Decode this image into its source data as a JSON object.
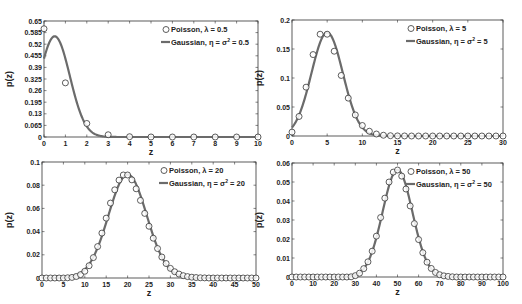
{
  "chart_data": [
    {
      "type": "line",
      "title": "",
      "xlabel": "z",
      "ylabel": "p(z)",
      "xlim": [
        0,
        10
      ],
      "ylim": [
        0,
        0.65
      ],
      "xticks": [
        "0",
        "1",
        "2",
        "3",
        "4",
        "5",
        "6",
        "7",
        "8",
        "9",
        "10"
      ],
      "xtick_values": [
        0,
        1,
        2,
        3,
        4,
        5,
        6,
        7,
        8,
        9,
        10
      ],
      "yticks": [
        "0",
        "0.065",
        "0.13",
        "0.195",
        "0.26",
        "0.325",
        "0.39",
        "0.455",
        "0.52",
        "0.585",
        "0.65"
      ],
      "ytick_values": [
        0,
        0.065,
        0.13,
        0.195,
        0.26,
        0.325,
        0.39,
        0.455,
        0.52,
        0.585,
        0.65
      ],
      "legend_position": "top-right",
      "series": [
        {
          "name": "Poisson, λ = 0.5",
          "style": "markers-circle",
          "x": [
            0,
            1,
            2,
            3,
            4,
            5,
            6,
            7,
            8,
            9,
            10
          ],
          "y": [
            0.6065,
            0.3033,
            0.0758,
            0.0126,
            0.0016,
            0.0002,
            0,
            0,
            0,
            0,
            0
          ]
        },
        {
          "name": "Gaussian, η = σ² = 0.5",
          "style": "line",
          "mean": 0.5,
          "variance": 0.5,
          "x_range": [
            0,
            10
          ]
        }
      ],
      "legend": {
        "poisson": "Poisson, λ = 0.5",
        "gaussian_prefix": "Gaussian, η = σ",
        "gaussian_suffix": " = 0.5"
      }
    },
    {
      "type": "line",
      "title": "",
      "xlabel": "z",
      "ylabel": "p(z)",
      "xlim": [
        0,
        30
      ],
      "ylim": [
        0,
        0.2
      ],
      "xticks": [
        "0",
        "5",
        "10",
        "15",
        "20",
        "25",
        "30"
      ],
      "xtick_values": [
        0,
        5,
        10,
        15,
        20,
        25,
        30
      ],
      "yticks": [
        "0",
        "0.05",
        "0.1",
        "0.15",
        "0.2"
      ],
      "ytick_values": [
        0,
        0.05,
        0.1,
        0.15,
        0.2
      ],
      "legend_position": "top-right",
      "series": [
        {
          "name": "Poisson, λ = 5",
          "style": "markers-circle",
          "x": [
            0,
            1,
            2,
            3,
            4,
            5,
            6,
            7,
            8,
            9,
            10,
            11,
            12,
            13,
            14,
            15,
            16,
            17,
            18,
            19,
            20,
            21,
            22,
            23,
            24,
            25,
            26,
            27,
            28,
            29,
            30
          ],
          "y": [
            0.0067,
            0.0337,
            0.0842,
            0.1404,
            0.1755,
            0.1755,
            0.1462,
            0.1044,
            0.0653,
            0.0363,
            0.0181,
            0.0082,
            0.0034,
            0.0013,
            0.0005,
            0.0002,
            0.0001,
            0,
            0,
            0,
            0,
            0,
            0,
            0,
            0,
            0,
            0,
            0,
            0,
            0,
            0
          ]
        },
        {
          "name": "Gaussian, η = σ² = 5",
          "style": "line",
          "mean": 5,
          "variance": 5,
          "x_range": [
            0,
            30
          ]
        }
      ],
      "legend": {
        "poisson": "Poisson, λ = 5",
        "gaussian_prefix": "Gaussian, η = σ",
        "gaussian_suffix": " = 5"
      }
    },
    {
      "type": "line",
      "title": "",
      "xlabel": "z",
      "ylabel": "p(z)",
      "xlim": [
        0,
        50
      ],
      "ylim": [
        0,
        0.1
      ],
      "xticks": [
        "0",
        "5",
        "10",
        "15",
        "20",
        "25",
        "30",
        "35",
        "40",
        "45",
        "50"
      ],
      "xtick_values": [
        0,
        5,
        10,
        15,
        20,
        25,
        30,
        35,
        40,
        45,
        50
      ],
      "yticks": [
        "0",
        "0.02",
        "0.04",
        "0.06",
        "0.08",
        "0.1"
      ],
      "ytick_values": [
        0,
        0.02,
        0.04,
        0.06,
        0.08,
        0.1
      ],
      "legend_position": "top-right",
      "series": [
        {
          "name": "Poisson, λ = 20",
          "style": "markers-circle",
          "x": [
            0,
            1,
            2,
            3,
            4,
            5,
            6,
            7,
            8,
            9,
            10,
            11,
            12,
            13,
            14,
            15,
            16,
            17,
            18,
            19,
            20,
            21,
            22,
            23,
            24,
            25,
            26,
            27,
            28,
            29,
            30,
            31,
            32,
            33,
            34,
            35,
            36,
            37,
            38,
            39,
            40,
            41,
            42,
            43,
            44,
            45,
            46,
            47,
            48,
            49,
            50
          ],
          "y": [
            0,
            0,
            0,
            0,
            0,
            0,
            0.0002,
            0.0005,
            0.0013,
            0.0029,
            0.0058,
            0.0106,
            0.0176,
            0.0271,
            0.0387,
            0.0516,
            0.0646,
            0.076,
            0.0844,
            0.0888,
            0.0888,
            0.0846,
            0.0769,
            0.0669,
            0.0557,
            0.0446,
            0.0343,
            0.0254,
            0.0181,
            0.0125,
            0.0083,
            0.0054,
            0.0034,
            0.002,
            0.0012,
            0.0007,
            0.0004,
            0.0002,
            0.0001,
            0,
            0,
            0,
            0,
            0,
            0,
            0,
            0,
            0,
            0,
            0,
            0
          ]
        },
        {
          "name": "Gaussian, η = σ² = 20",
          "style": "line",
          "mean": 20,
          "variance": 20,
          "x_range": [
            0,
            50
          ]
        }
      ],
      "legend": {
        "poisson": "Poisson, λ = 20",
        "gaussian_prefix": "Gaussian, η = σ",
        "gaussian_suffix": " = 20"
      }
    },
    {
      "type": "line",
      "title": "",
      "xlabel": "z",
      "ylabel": "p(z)",
      "xlim": [
        0,
        100
      ],
      "ylim": [
        0,
        0.06
      ],
      "xticks": [
        "0",
        "10",
        "20",
        "30",
        "40",
        "50",
        "60",
        "70",
        "80",
        "90",
        "100"
      ],
      "xtick_values": [
        0,
        10,
        20,
        30,
        40,
        50,
        60,
        70,
        80,
        90,
        100
      ],
      "yticks": [
        "0",
        "0.01",
        "0.02",
        "0.03",
        "0.04",
        "0.05",
        "0.06"
      ],
      "ytick_values": [
        0,
        0.01,
        0.02,
        0.03,
        0.04,
        0.05,
        0.06
      ],
      "legend_position": "top-right",
      "series": [
        {
          "name": "Poisson, λ = 50",
          "style": "markers-circle",
          "x": [
            0,
            2,
            4,
            6,
            8,
            10,
            12,
            14,
            16,
            18,
            20,
            22,
            24,
            26,
            28,
            30,
            32,
            34,
            36,
            38,
            40,
            42,
            44,
            46,
            48,
            50,
            52,
            54,
            56,
            58,
            60,
            62,
            64,
            66,
            68,
            70,
            72,
            74,
            76,
            78,
            80,
            82,
            84,
            86,
            88,
            90,
            92,
            94,
            96,
            98,
            100
          ],
          "y": [
            0,
            0,
            0,
            0,
            0,
            0,
            0,
            0,
            0,
            0,
            0,
            0,
            0,
            0,
            0.0001,
            0.0007,
            0.002,
            0.0044,
            0.008,
            0.0136,
            0.0215,
            0.0313,
            0.0415,
            0.05,
            0.0552,
            0.0563,
            0.0531,
            0.0463,
            0.0374,
            0.0281,
            0.0197,
            0.0128,
            0.0078,
            0.0045,
            0.0024,
            0.0012,
            0.0006,
            0.0003,
            0.0001,
            0,
            0,
            0,
            0,
            0,
            0,
            0,
            0,
            0,
            0,
            0,
            0
          ]
        },
        {
          "name": "Gaussian, η = σ² = 50",
          "style": "line",
          "mean": 50,
          "variance": 50,
          "x_range": [
            0,
            100
          ]
        }
      ],
      "legend": {
        "poisson": "Poisson, λ = 50",
        "gaussian_prefix": "Gaussian, η = σ",
        "gaussian_suffix": " = 50"
      }
    }
  ],
  "colors": {
    "gaussian_line": "#6b6b6b",
    "marker_stroke": "#333333",
    "axis": "#333333",
    "background": "#ffffff"
  },
  "superscript": "2"
}
